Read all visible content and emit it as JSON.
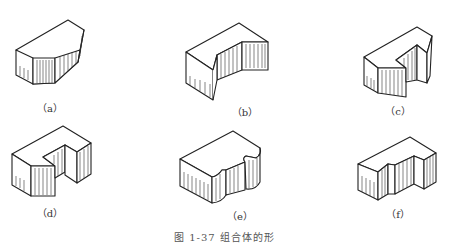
{
  "figures": [
    {
      "id": "a",
      "label": "（a）",
      "shape": "truncated-prism"
    },
    {
      "id": "b",
      "label": "（b）",
      "shape": "notched-block"
    },
    {
      "id": "c",
      "label": "（c）",
      "shape": "c-block"
    },
    {
      "id": "d",
      "label": "（d）",
      "shape": "u-block"
    },
    {
      "id": "e",
      "label": "（e）",
      "shape": "rounded-notch-block"
    },
    {
      "id": "f",
      "label": "（f）",
      "shape": "stepped-block"
    }
  ],
  "caption": "图 1-37  组合体的形"
}
